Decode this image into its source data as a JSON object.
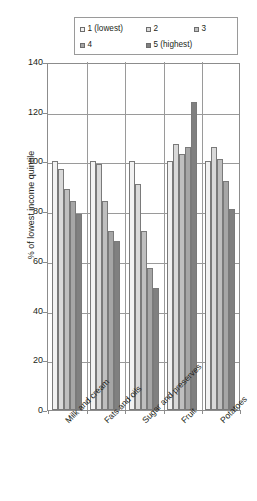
{
  "chart_data": {
    "type": "bar",
    "title": "",
    "xlabel": "",
    "ylabel": "% of lowest income quintile",
    "ylim": [
      0,
      140
    ],
    "ytick_step": 20,
    "yticks": [
      0,
      20,
      40,
      60,
      80,
      100,
      120,
      140
    ],
    "grid": true,
    "legend_position": "top",
    "categories": [
      "Milk and cream",
      "Fats and oils",
      "Sugar and preserves",
      "Fruit",
      "Potatoes"
    ],
    "series": [
      {
        "name": "1 (lowest)",
        "color": "#f2f2f2",
        "values": [
          100,
          100,
          100,
          100,
          100
        ]
      },
      {
        "name": "2",
        "color": "#d9d9d9",
        "values": [
          97,
          99,
          91,
          107,
          106
        ]
      },
      {
        "name": "3",
        "color": "#bfbfbf",
        "values": [
          89,
          84,
          72,
          103,
          101
        ]
      },
      {
        "name": "4",
        "color": "#a6a6a6",
        "values": [
          84,
          72,
          57,
          106,
          92
        ]
      },
      {
        "name": "5 (highest)",
        "color": "#808080",
        "values": [
          79,
          68,
          49,
          124,
          81
        ]
      }
    ]
  },
  "legend": {
    "items": [
      {
        "label": "1 (lowest)",
        "color": "#f2f2f2"
      },
      {
        "label": "2",
        "color": "#d9d9d9"
      },
      {
        "label": "3",
        "color": "#bfbfbf"
      },
      {
        "label": "4",
        "color": "#a6a6a6"
      },
      {
        "label": "5 (highest)",
        "color": "#808080"
      }
    ]
  },
  "axis": {
    "y_title": "% of lowest income quintile",
    "y_labels": [
      "140",
      "120",
      "100",
      "80",
      "60",
      "40",
      "20",
      "0"
    ]
  }
}
